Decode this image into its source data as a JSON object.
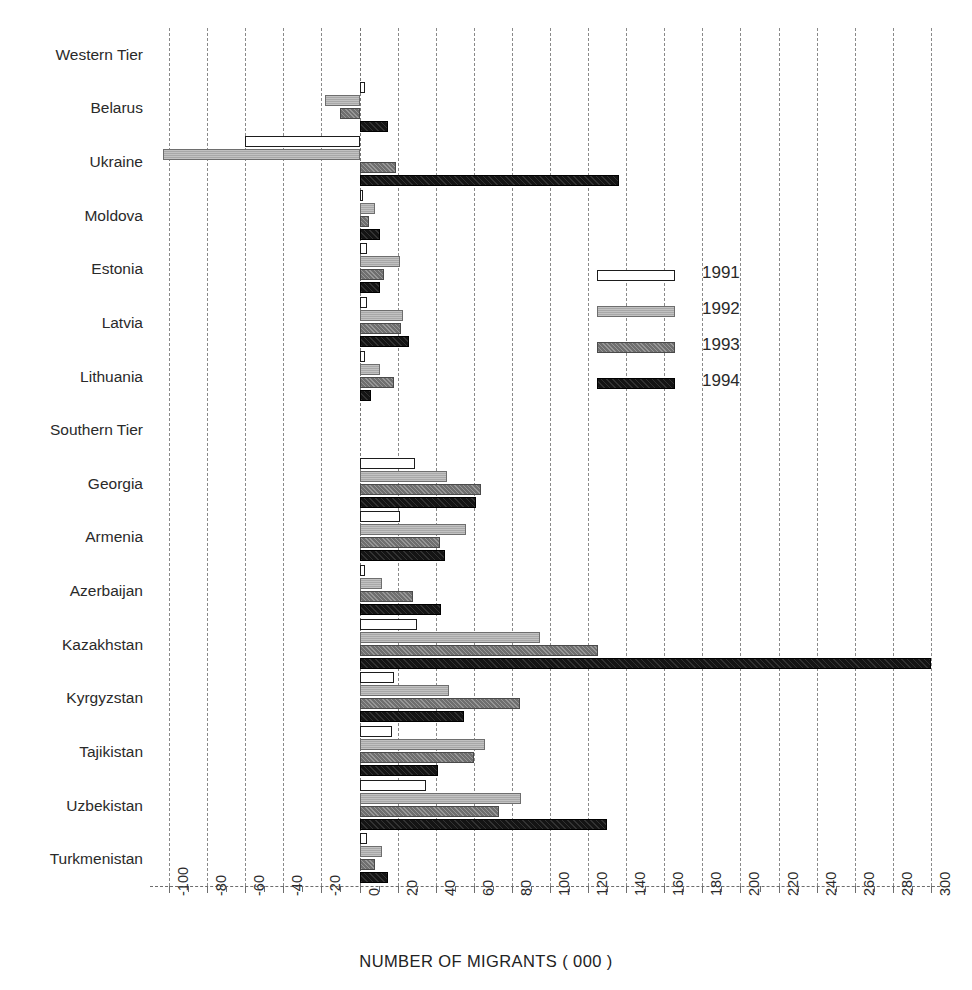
{
  "chart_data": {
    "type": "bar",
    "orientation": "horizontal",
    "title": "",
    "xlabel": "NUMBER OF MIGRANTS ( 000 )",
    "ylabel": "",
    "xlim": [
      -110,
      310
    ],
    "xticks": [
      -100,
      -80,
      -60,
      -40,
      -20,
      0,
      20,
      40,
      60,
      80,
      100,
      120,
      140,
      160,
      180,
      200,
      220,
      240,
      260,
      280,
      300
    ],
    "xtick_labels": [
      "-100",
      "-80",
      "-60",
      "-40",
      "-20",
      "0",
      "20",
      "40",
      "60",
      "80",
      "100",
      "120",
      "140",
      "160",
      "180",
      "200",
      "220",
      "240",
      "260",
      "280",
      "300"
    ],
    "grid": true,
    "legend_position": "center-right",
    "legend": [
      "1991",
      "1992",
      "1993",
      "1994"
    ],
    "categories": [
      "Western Tier",
      "Belarus",
      "Ukraine",
      "Moldova",
      "Estonia",
      "Latvia",
      "Lithuania",
      "Southern Tier",
      "Georgia",
      "Armenia",
      "Azerbaijan",
      "Kazakhstan",
      "Kyrgyzstan",
      "Tajikistan",
      "Uzbekistan",
      "Turkmenistan"
    ],
    "header_categories": [
      "Western Tier",
      "Southern Tier"
    ],
    "series": [
      {
        "name": "1991",
        "color": "#ffffff",
        "values": [
          null,
          3,
          -60,
          2,
          4,
          4,
          3,
          null,
          29,
          21,
          3,
          30,
          18,
          17,
          35,
          4
        ]
      },
      {
        "name": "1992",
        "color": "#a8a8a8",
        "values": [
          null,
          -18,
          -103,
          8,
          21,
          23,
          11,
          null,
          46,
          56,
          12,
          95,
          47,
          66,
          85,
          12
        ]
      },
      {
        "name": "1993",
        "color": "#6f6f6f",
        "values": [
          null,
          -10,
          19,
          5,
          13,
          22,
          18,
          null,
          64,
          42,
          28,
          125,
          84,
          60,
          73,
          8
        ]
      },
      {
        "name": "1994",
        "color": "#141414",
        "values": [
          null,
          15,
          136,
          11,
          11,
          26,
          6,
          null,
          61,
          45,
          43,
          300,
          55,
          41,
          130,
          15
        ]
      }
    ]
  },
  "axis": {
    "title": "NUMBER OF MIGRANTS ( 000 )"
  },
  "legend": {
    "items": [
      {
        "label": "1991"
      },
      {
        "label": "1992"
      },
      {
        "label": "1993"
      },
      {
        "label": "1994"
      }
    ]
  }
}
